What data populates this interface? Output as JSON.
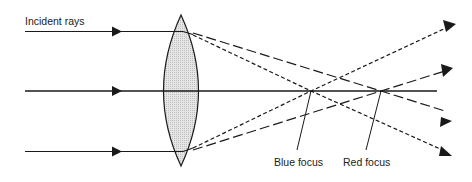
{
  "diagram": {
    "labels": {
      "incident_rays": "Incident rays",
      "blue_focus": "Blue focus",
      "red_focus": "Red focus"
    },
    "colors": {
      "line": "#1a1a1a",
      "lens_fill": "#d9d9d9",
      "background": "#ffffff"
    },
    "elements": {
      "incident_rays": 3,
      "lens": "biconvex",
      "blue_rays_style": "short-dash",
      "red_rays_style": "long-dash"
    }
  }
}
